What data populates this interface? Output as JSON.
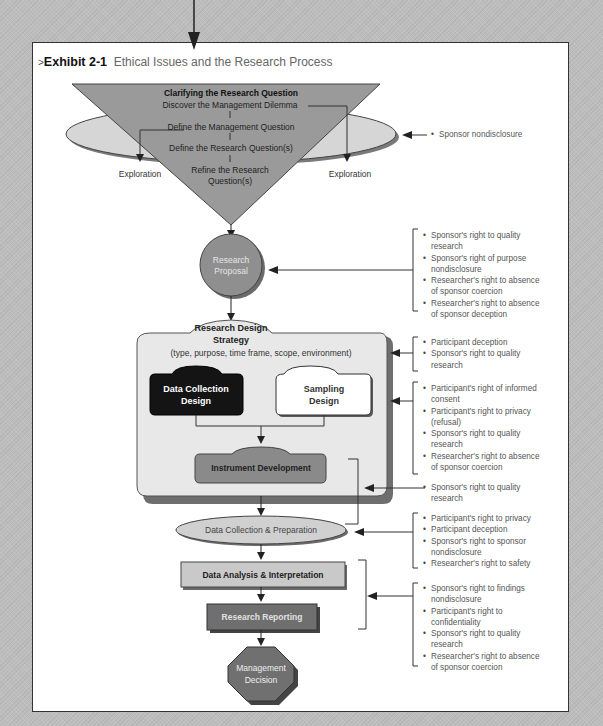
{
  "exhibit": {
    "number": "Exhibit 2-1",
    "title": "Ethical Issues and the Research Process"
  },
  "funnel": {
    "heading": "Clarifying the Research Question",
    "steps": [
      "Discover the Management Dilemma",
      "Define the Management Question",
      "Define the Research Question(s)",
      "Refine the Research",
      "Question(s)"
    ],
    "exploration_left": "Exploration",
    "exploration_right": "Exploration"
  },
  "nodes": {
    "proposal_line1": "Research",
    "proposal_line2": "Proposal",
    "strategy_line1": "Research Design",
    "strategy_line2": "Strategy",
    "strategy_sub": "(type, purpose, time frame, scope, environment)",
    "data_collection_design_1": "Data Collection",
    "data_collection_design_2": "Design",
    "sampling_design_1": "Sampling",
    "sampling_design_2": "Design",
    "instrument": "Instrument Development",
    "collection_prep": "Data Collection & Preparation",
    "analysis": "Data Analysis & Interpretation",
    "reporting": "Research Reporting",
    "decision_1": "Management",
    "decision_2": "Decision"
  },
  "issues": {
    "funnel": [
      "Sponsor nondisclosure"
    ],
    "proposal": [
      "Sponsor's right to quality",
      "research",
      "Sponsor's right of purpose",
      "nondisclosure",
      "Researcher's right to absence",
      "of sponsor coercion",
      "Researcher's right to absence",
      "of sponsor deception"
    ],
    "strategy": [
      "Participant deception",
      "Sponsor's right to quality",
      "research"
    ],
    "design": [
      "Participant's right of informed",
      "consent",
      "Participant's right to privacy",
      "(refusal)",
      "Sponsor's right to quality",
      "research",
      "Researcher's right to absence",
      "of sponsor coercion"
    ],
    "instrument": [
      "Sponsor's right to quality",
      "research"
    ],
    "collection": [
      "Participant's right to privacy",
      "Participant deception",
      "Sponsor's right to sponsor",
      "nondisclosure",
      "Researcher's right to safety"
    ],
    "analysis": [
      "Sponsor's right to findings",
      "nondisclosure",
      "Participant's right to",
      "confidentiality",
      "Sponsor's right to quality",
      "research",
      "Researcher's right to absence",
      "of sponsor coercion"
    ]
  },
  "colors": {
    "funnel": "#9a9a9a",
    "ellipse": "#d6d6d6",
    "proposal": "#8f8f8f",
    "strategy_box": "#e8e8e8",
    "data_collection_design": "#141414",
    "sampling_design": "#ffffff",
    "instrument": "#8a8a8a",
    "analysis": "#c9c9c9",
    "reporting": "#6f6f6f",
    "decision": "#707070"
  }
}
